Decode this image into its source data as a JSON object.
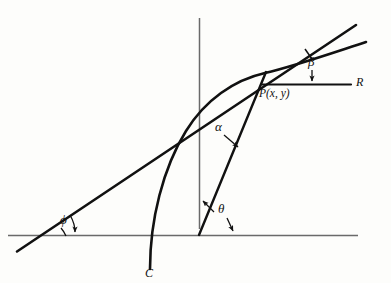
{
  "figure": {
    "type": "math-diagram",
    "axes": {
      "x_label": "x",
      "y_label": "y",
      "origin_px": [
        199,
        235
      ],
      "x_axis_px": [
        [
          8,
          235
        ],
        [
          358,
          235
        ]
      ],
      "y_axis_px": [
        [
          199,
          228
        ],
        [
          199,
          18
        ]
      ]
    },
    "labels": {
      "point_p": "P(x, y)",
      "curve": "C",
      "ray": "R",
      "angle_alpha": "α",
      "angle_beta": "β",
      "angle_theta": "θ",
      "angle_phi": "ϕ"
    },
    "elements": {
      "point_p_px": [
        265,
        73
      ],
      "tangent_line_px": [
        [
          18,
          251
        ],
        [
          356,
          25
        ]
      ],
      "radius_vector_px": [
        [
          199,
          235
        ],
        [
          265,
          73
        ]
      ],
      "ray_r_px": [
        [
          263,
          84
        ],
        [
          352,
          84
        ]
      ],
      "curve_start_px": [
        150,
        269
      ],
      "curve_end_px": [
        366,
        42
      ]
    },
    "colors": {
      "ink": "#111111",
      "axis": "#555555",
      "paper": "#fdfdfb"
    }
  },
  "bleed_through": {
    "line1": "",
    "line2": "",
    "line3": ""
  }
}
